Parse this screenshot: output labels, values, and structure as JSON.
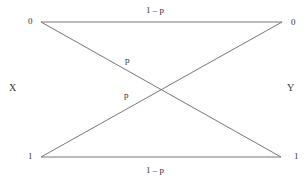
{
  "diagram": {
    "input_label": "X",
    "output_label": "Y",
    "inputs": [
      "0",
      "1"
    ],
    "outputs": [
      "0",
      "1"
    ],
    "edges": [
      {
        "from": "0",
        "to": "0",
        "label": "1 – p"
      },
      {
        "from": "1",
        "to": "1",
        "label": "1 – p"
      },
      {
        "from": "0",
        "to": "1",
        "label": "p"
      },
      {
        "from": "1",
        "to": "0",
        "label": "p"
      }
    ],
    "line_color": "#777777"
  }
}
